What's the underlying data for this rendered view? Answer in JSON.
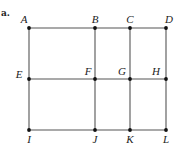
{
  "part_label": "a.",
  "colors": {
    "edge": "#555555",
    "vertex": "#111111",
    "label": "#222222"
  },
  "vertices": [
    {
      "id": "A",
      "x": 29,
      "y": 28,
      "lx": 24,
      "ly": 14
    },
    {
      "id": "B",
      "x": 95,
      "y": 28,
      "lx": 95,
      "ly": 14
    },
    {
      "id": "C",
      "x": 130,
      "y": 28,
      "lx": 130,
      "ly": 14
    },
    {
      "id": "D",
      "x": 166,
      "y": 28,
      "lx": 169,
      "ly": 14
    },
    {
      "id": "E",
      "x": 29,
      "y": 79,
      "lx": 19,
      "ly": 69
    },
    {
      "id": "F",
      "x": 95,
      "y": 79,
      "lx": 88,
      "ly": 66
    },
    {
      "id": "G",
      "x": 130,
      "y": 79,
      "lx": 122,
      "ly": 66
    },
    {
      "id": "H",
      "x": 166,
      "y": 79,
      "lx": 156,
      "ly": 66
    },
    {
      "id": "I",
      "x": 29,
      "y": 130,
      "lx": 29,
      "ly": 134
    },
    {
      "id": "J",
      "x": 95,
      "y": 130,
      "lx": 95,
      "ly": 134
    },
    {
      "id": "K",
      "x": 130,
      "y": 130,
      "lx": 130,
      "ly": 134
    },
    {
      "id": "L",
      "x": 166,
      "y": 130,
      "lx": 166,
      "ly": 134
    }
  ],
  "edges": [
    [
      "A",
      "B"
    ],
    [
      "B",
      "C"
    ],
    [
      "C",
      "D"
    ],
    [
      "E",
      "F"
    ],
    [
      "F",
      "G"
    ],
    [
      "G",
      "H"
    ],
    [
      "I",
      "J"
    ],
    [
      "J",
      "K"
    ],
    [
      "K",
      "L"
    ],
    [
      "A",
      "E"
    ],
    [
      "E",
      "I"
    ],
    [
      "B",
      "F"
    ],
    [
      "F",
      "J"
    ],
    [
      "C",
      "G"
    ],
    [
      "G",
      "K"
    ],
    [
      "D",
      "H"
    ],
    [
      "H",
      "L"
    ]
  ]
}
